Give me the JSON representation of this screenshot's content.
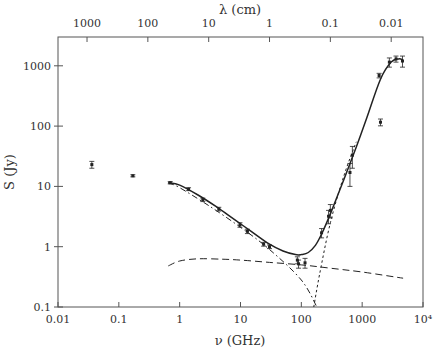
{
  "chart_data": {
    "type": "scatter",
    "title": "",
    "xlabel": "ν (GHz)",
    "ylabel": "S (Jy)",
    "x2label": "λ (cm)",
    "xscale": "log",
    "yscale": "log",
    "xlim": [
      0.01,
      10000
    ],
    "ylim": [
      0.1,
      3000
    ],
    "grid": false,
    "legend": null,
    "x_ticks": [
      {
        "value": 0.01,
        "label": "0.01"
      },
      {
        "value": 0.1,
        "label": "0.1"
      },
      {
        "value": 1,
        "label": "1"
      },
      {
        "value": 10,
        "label": "10"
      },
      {
        "value": 100,
        "label": "100"
      },
      {
        "value": 1000,
        "label": "1000"
      },
      {
        "value": 10000,
        "label": "10⁴"
      }
    ],
    "y_ticks": [
      {
        "value": 0.1,
        "label": "0.1"
      },
      {
        "value": 1,
        "label": "1"
      },
      {
        "value": 10,
        "label": "10"
      },
      {
        "value": 100,
        "label": "100"
      },
      {
        "value": 1000,
        "label": "1000"
      }
    ],
    "x2_ticks": [
      {
        "freq_ghz": 0.03,
        "label": "1000"
      },
      {
        "freq_ghz": 0.3,
        "label": "100"
      },
      {
        "freq_ghz": 3,
        "label": "10"
      },
      {
        "freq_ghz": 30,
        "label": "1"
      },
      {
        "freq_ghz": 300,
        "label": "0.1"
      },
      {
        "freq_ghz": 3000,
        "label": "0.01"
      }
    ],
    "series": [
      {
        "name": "measurements",
        "style": "points-with-errorbars",
        "points": [
          {
            "x": 0.036,
            "y": 23,
            "err": 3
          },
          {
            "x": 0.17,
            "y": 15,
            "err": 0.6
          },
          {
            "x": 0.7,
            "y": 11.5,
            "err": 0.5
          },
          {
            "x": 1.4,
            "y": 9,
            "err": 0.5
          },
          {
            "x": 2.4,
            "y": 6,
            "err": 0.4
          },
          {
            "x": 4.4,
            "y": 4.2,
            "err": 0.3
          },
          {
            "x": 9.8,
            "y": 2.3,
            "err": 0.2
          },
          {
            "x": 13,
            "y": 1.8,
            "err": 0.15
          },
          {
            "x": 24,
            "y": 1.1,
            "err": 0.08
          },
          {
            "x": 30,
            "y": 1.0,
            "err": 0.07
          },
          {
            "x": 86,
            "y": 0.6,
            "err": 0.08
          },
          {
            "x": 90,
            "y": 0.52,
            "err": 0.08
          },
          {
            "x": 115,
            "y": 0.54,
            "err": 0.1
          },
          {
            "x": 215,
            "y": 1.7,
            "err": 0.3
          },
          {
            "x": 280,
            "y": 3.2,
            "err": 0.8
          },
          {
            "x": 300,
            "y": 4,
            "err": 1
          },
          {
            "x": 630,
            "y": 17,
            "err": 7
          },
          {
            "x": 690,
            "y": 33,
            "err": 13
          },
          {
            "x": 1900,
            "y": 690,
            "err": 60
          },
          {
            "x": 2000,
            "y": 116,
            "err": 15
          },
          {
            "x": 2800,
            "y": 1150,
            "err": 200
          },
          {
            "x": 3600,
            "y": 1300,
            "err": 150
          },
          {
            "x": 4600,
            "y": 1200,
            "err": 250
          }
        ]
      },
      {
        "name": "total model",
        "style": "solid",
        "x": [
          0.65,
          1,
          2,
          4,
          8,
          15,
          30,
          50,
          80,
          100,
          130,
          170,
          220,
          300,
          500,
          800,
          1200,
          2000,
          3000,
          4000,
          4700
        ],
        "y": [
          11.5,
          10.5,
          7.2,
          4.6,
          2.8,
          1.8,
          1.1,
          0.85,
          0.74,
          0.74,
          0.8,
          1.05,
          1.7,
          3.5,
          13,
          45,
          140,
          600,
          1150,
          1300,
          1250
        ]
      },
      {
        "name": "synchrotron component",
        "style": "dash-dot",
        "x": [
          0.65,
          1,
          3,
          10,
          30,
          100,
          180
        ],
        "y": [
          11.5,
          9.5,
          4.8,
          2.1,
          0.9,
          0.28,
          0.1
        ]
      },
      {
        "name": "free-free component",
        "style": "dashed",
        "x": [
          0.65,
          1,
          2,
          5,
          10,
          30,
          100,
          300,
          1000,
          4700
        ],
        "y": [
          0.48,
          0.58,
          0.63,
          0.62,
          0.6,
          0.55,
          0.5,
          0.44,
          0.38,
          0.3
        ]
      },
      {
        "name": "dust component",
        "style": "dotted",
        "x": [
          160,
          200,
          300,
          500,
          800
        ],
        "y": [
          0.1,
          0.35,
          2.5,
          15,
          55
        ]
      }
    ]
  }
}
